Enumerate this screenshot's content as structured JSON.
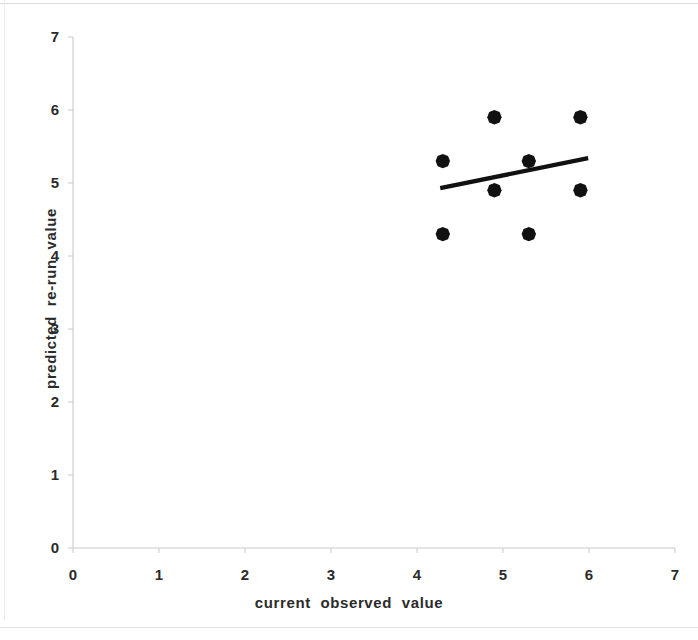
{
  "chart_data": {
    "type": "scatter",
    "title": "",
    "xlabel": "current  observed  value",
    "ylabel": "predicted  re-run  value",
    "xlim": [
      0,
      7
    ],
    "ylim": [
      0,
      7
    ],
    "xticks": [
      "0",
      "1",
      "2",
      "3",
      "4",
      "5",
      "6",
      "7"
    ],
    "yticks": [
      "0",
      "1",
      "2",
      "3",
      "4",
      "5",
      "6",
      "7"
    ],
    "grid": false,
    "legend": null,
    "marker": "filled-diamond",
    "marker_color": "#111111",
    "points": [
      {
        "x": 4.3,
        "y": 4.3
      },
      {
        "x": 4.3,
        "y": 5.3
      },
      {
        "x": 4.9,
        "y": 4.9
      },
      {
        "x": 4.9,
        "y": 5.9
      },
      {
        "x": 5.3,
        "y": 4.3
      },
      {
        "x": 5.3,
        "y": 5.3
      },
      {
        "x": 5.9,
        "y": 4.9
      },
      {
        "x": 5.9,
        "y": 5.9
      }
    ],
    "trendline": {
      "type": "linear-fit",
      "color": "#111111",
      "x_start": 4.27,
      "y_start": 4.93,
      "x_end": 5.99,
      "y_end": 5.34
    },
    "axis_color": "#c9c9c9"
  }
}
